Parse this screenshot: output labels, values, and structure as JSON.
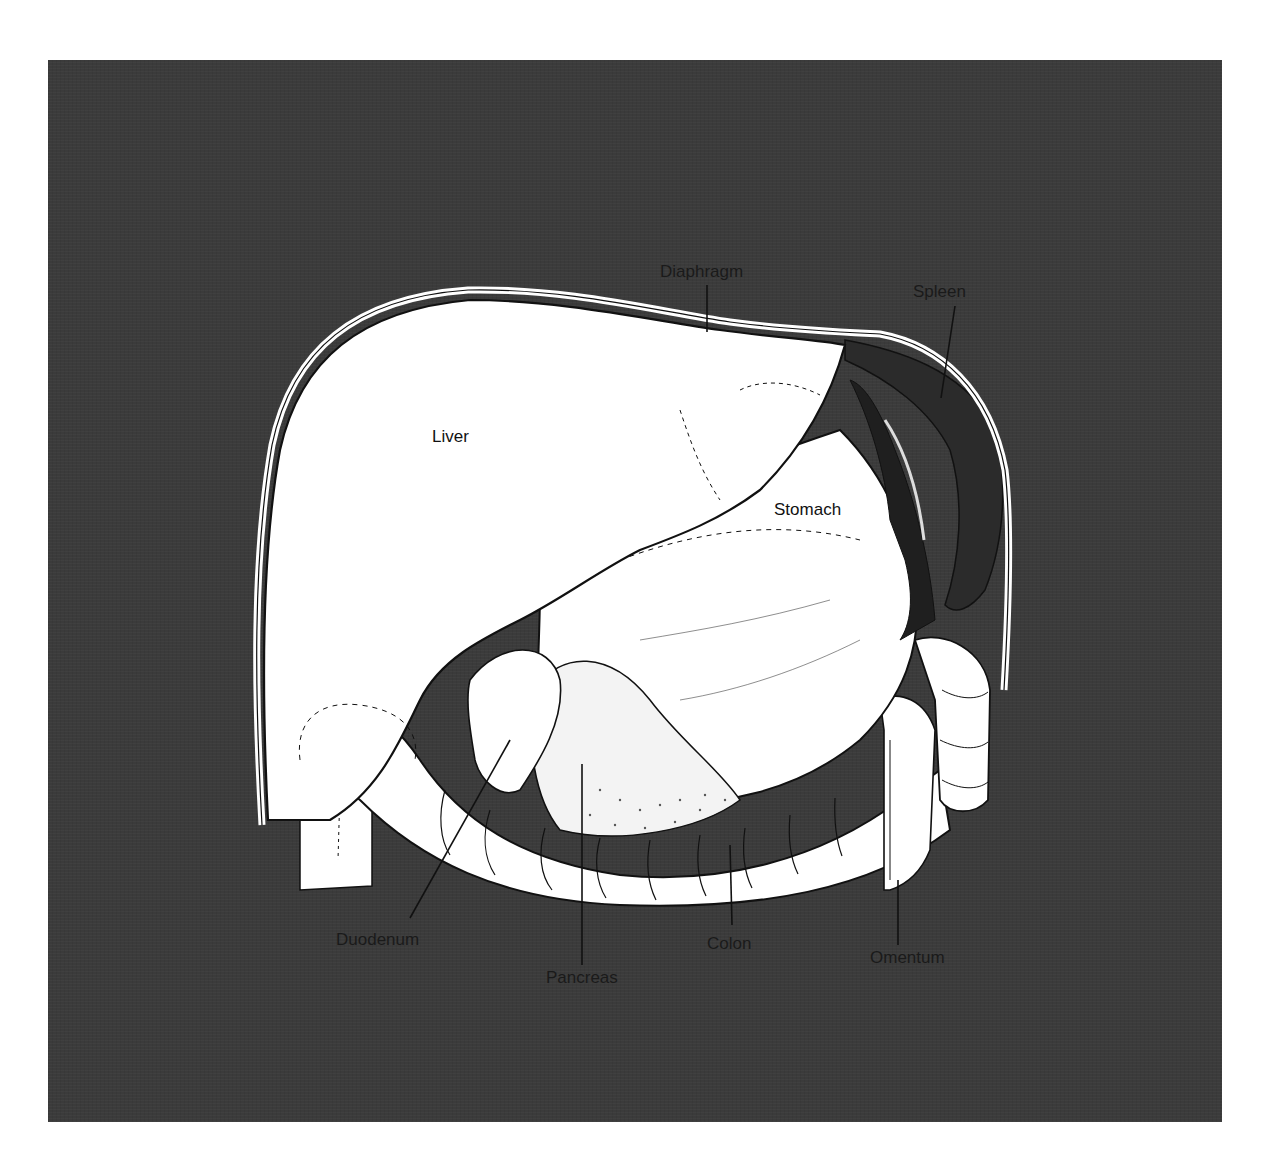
{
  "figure": {
    "background_color": "#ffffff",
    "panel_color": "#3b3b3b",
    "organ_fill": "#ffffff",
    "spleen_color": "#2b2b2b",
    "outline_color": "#111111"
  },
  "labels": {
    "diaphragm": "Diaphragm",
    "spleen": "Spleen",
    "liver": "Liver",
    "stomach": "Stomach",
    "duodenum": "Duodenum",
    "pancreas": "Pancreas",
    "colon": "Colon",
    "omentum": "Omentum"
  }
}
